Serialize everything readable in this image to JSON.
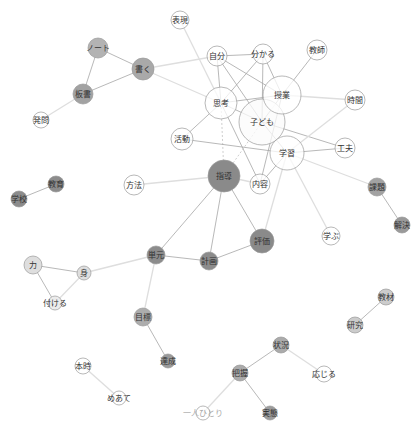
{
  "diagram": {
    "type": "co-occurrence-network",
    "width": 419,
    "height": 429,
    "colors": {
      "background": "#ffffff",
      "edge_solid": "#a6a6a6",
      "edge_light": "#dedede",
      "edge_dashed": "#c2c2c2",
      "node_stroke": "#9a9a9a",
      "label": "#333333",
      "label_faint": "#a8a8a8"
    },
    "nodes": [
      {
        "label": "表現",
        "x": 180,
        "y": 20,
        "r": 9,
        "fill": "#ffffff"
      },
      {
        "label": "ノート",
        "x": 98,
        "y": 48,
        "r": 10,
        "fill": "#b3b3b3"
      },
      {
        "label": "書く",
        "x": 143,
        "y": 69,
        "r": 11,
        "fill": "#a9a9a9"
      },
      {
        "label": "板書",
        "x": 83,
        "y": 94,
        "r": 10,
        "fill": "#a2a2a2"
      },
      {
        "label": "発問",
        "x": 41,
        "y": 120,
        "r": 8,
        "fill": "#ffffff"
      },
      {
        "label": "自分",
        "x": 217,
        "y": 56,
        "r": 10,
        "fill": "#ffffff"
      },
      {
        "label": "分かる",
        "x": 263,
        "y": 54,
        "r": 10,
        "fill": "#ffffff"
      },
      {
        "label": "教師",
        "x": 317,
        "y": 50,
        "r": 10,
        "fill": "#ffffff"
      },
      {
        "label": "思考",
        "x": 221,
        "y": 103,
        "r": 16,
        "fill": "#ffffff"
      },
      {
        "label": "授業",
        "x": 282,
        "y": 95,
        "r": 19,
        "fill": "#ffffff"
      },
      {
        "label": "子ども",
        "x": 262,
        "y": 122,
        "r": 23,
        "fill": "#fbfbfb"
      },
      {
        "label": "時間",
        "x": 355,
        "y": 100,
        "r": 10,
        "fill": "#ffffff"
      },
      {
        "label": "活動",
        "x": 182,
        "y": 139,
        "r": 11,
        "fill": "#ffffff"
      },
      {
        "label": "工夫",
        "x": 345,
        "y": 148,
        "r": 10,
        "fill": "#ffffff"
      },
      {
        "label": "学習",
        "x": 287,
        "y": 153,
        "r": 17,
        "fill": "#ffffff"
      },
      {
        "label": "指導",
        "x": 224,
        "y": 176,
        "r": 16,
        "fill": "#8a8a8a"
      },
      {
        "label": "内容",
        "x": 260,
        "y": 184,
        "r": 10,
        "fill": "#ffffff"
      },
      {
        "label": "方法",
        "x": 134,
        "y": 185,
        "r": 10,
        "fill": "#ffffff"
      },
      {
        "label": "教育",
        "x": 56,
        "y": 184,
        "r": 8,
        "fill": "#8c8c8c"
      },
      {
        "label": "学校",
        "x": 19,
        "y": 199,
        "r": 8,
        "fill": "#8c8c8c"
      },
      {
        "label": "課題",
        "x": 377,
        "y": 187,
        "r": 9,
        "fill": "#a2a2a2"
      },
      {
        "label": "解決",
        "x": 402,
        "y": 225,
        "r": 8,
        "fill": "#9a9a9a"
      },
      {
        "label": "学ぶ",
        "x": 331,
        "y": 236,
        "r": 9,
        "fill": "#ffffff"
      },
      {
        "label": "評価",
        "x": 262,
        "y": 241,
        "r": 12,
        "fill": "#8a8a8a"
      },
      {
        "label": "計画",
        "x": 209,
        "y": 261,
        "r": 9,
        "fill": "#8c8c8c"
      },
      {
        "label": "単元",
        "x": 156,
        "y": 255,
        "r": 9,
        "fill": "#8c8c8c"
      },
      {
        "label": "力",
        "x": 33,
        "y": 265,
        "r": 9,
        "fill": "#dedede"
      },
      {
        "label": "身",
        "x": 84,
        "y": 273,
        "r": 7,
        "fill": "#dedede"
      },
      {
        "label": "付ける",
        "x": 55,
        "y": 303,
        "r": 7,
        "fill": "#ececec"
      },
      {
        "label": "目標",
        "x": 143,
        "y": 317,
        "r": 9,
        "fill": "#adadad"
      },
      {
        "label": "達成",
        "x": 168,
        "y": 361,
        "r": 7,
        "fill": "#9a9a9a"
      },
      {
        "label": "教材",
        "x": 386,
        "y": 297,
        "r": 8,
        "fill": "#cccccc"
      },
      {
        "label": "研究",
        "x": 355,
        "y": 325,
        "r": 8,
        "fill": "#cccccc"
      },
      {
        "label": "状況",
        "x": 281,
        "y": 345,
        "r": 8,
        "fill": "#ababab"
      },
      {
        "label": "把握",
        "x": 240,
        "y": 373,
        "r": 8,
        "fill": "#ababab"
      },
      {
        "label": "応じる",
        "x": 324,
        "y": 374,
        "r": 8,
        "fill": "#ffffff"
      },
      {
        "label": "実態",
        "x": 270,
        "y": 413,
        "r": 7,
        "fill": "#9c9c9c"
      },
      {
        "label": "本時",
        "x": 83,
        "y": 366,
        "r": 8,
        "fill": "#ffffff"
      },
      {
        "label": "めあて",
        "x": 119,
        "y": 398,
        "r": 7,
        "fill": "#ffffff"
      },
      {
        "label": "一人ひとり",
        "x": 203,
        "y": 413,
        "r": 7,
        "fill": "#ffffff",
        "faint": true
      }
    ],
    "edges": [
      {
        "from": "ノート",
        "to": "書く",
        "style": "solid"
      },
      {
        "from": "ノート",
        "to": "板書",
        "style": "solid"
      },
      {
        "from": "書く",
        "to": "板書",
        "style": "solid"
      },
      {
        "from": "板書",
        "to": "発問",
        "style": "light"
      },
      {
        "from": "書く",
        "to": "自分",
        "style": "light"
      },
      {
        "from": "書く",
        "to": "思考",
        "style": "light"
      },
      {
        "from": "表現",
        "to": "思考",
        "style": "light"
      },
      {
        "from": "自分",
        "to": "分かる",
        "style": "solid"
      },
      {
        "from": "自分",
        "to": "思考",
        "style": "solid"
      },
      {
        "from": "自分",
        "to": "授業",
        "style": "solid"
      },
      {
        "from": "自分",
        "to": "子ども",
        "style": "solid"
      },
      {
        "from": "分かる",
        "to": "思考",
        "style": "solid"
      },
      {
        "from": "分かる",
        "to": "授業",
        "style": "solid"
      },
      {
        "from": "分かる",
        "to": "子ども",
        "style": "solid"
      },
      {
        "from": "教師",
        "to": "授業",
        "style": "solid"
      },
      {
        "from": "思考",
        "to": "授業",
        "style": "solid"
      },
      {
        "from": "思考",
        "to": "子ども",
        "style": "solid"
      },
      {
        "from": "思考",
        "to": "活動",
        "style": "solid"
      },
      {
        "from": "思考",
        "to": "内容",
        "style": "solid"
      },
      {
        "from": "思考",
        "to": "指導",
        "style": "dashed"
      },
      {
        "from": "授業",
        "to": "子ども",
        "style": "solid"
      },
      {
        "from": "授業",
        "to": "時間",
        "style": "light"
      },
      {
        "from": "授業",
        "to": "内容",
        "style": "solid"
      },
      {
        "from": "子ども",
        "to": "工夫",
        "style": "solid"
      },
      {
        "from": "子ども",
        "to": "学習",
        "style": "solid"
      },
      {
        "from": "子ども",
        "to": "指導",
        "style": "dashed"
      },
      {
        "from": "活動",
        "to": "学習",
        "style": "solid"
      },
      {
        "from": "学習",
        "to": "工夫",
        "style": "solid"
      },
      {
        "from": "学習",
        "to": "内容",
        "style": "solid"
      },
      {
        "from": "学習",
        "to": "時間",
        "style": "light"
      },
      {
        "from": "学習",
        "to": "課題",
        "style": "light"
      },
      {
        "from": "学習",
        "to": "学ぶ",
        "style": "light"
      },
      {
        "from": "学習",
        "to": "評価",
        "style": "light"
      },
      {
        "from": "課題",
        "to": "解決",
        "style": "solid"
      },
      {
        "from": "指導",
        "to": "方法",
        "style": "light"
      },
      {
        "from": "指導",
        "to": "内容",
        "style": "light"
      },
      {
        "from": "指導",
        "to": "単元",
        "style": "solid"
      },
      {
        "from": "指導",
        "to": "計画",
        "style": "solid"
      },
      {
        "from": "指導",
        "to": "評価",
        "style": "solid"
      },
      {
        "from": "単元",
        "to": "計画",
        "style": "solid"
      },
      {
        "from": "計画",
        "to": "評価",
        "style": "solid"
      },
      {
        "from": "単元",
        "to": "身",
        "style": "light"
      },
      {
        "from": "単元",
        "to": "目標",
        "style": "light"
      },
      {
        "from": "目標",
        "to": "達成",
        "style": "solid"
      },
      {
        "from": "力",
        "to": "身",
        "style": "solid"
      },
      {
        "from": "力",
        "to": "付ける",
        "style": "solid"
      },
      {
        "from": "身",
        "to": "付ける",
        "style": "light"
      },
      {
        "from": "教育",
        "to": "学校",
        "style": "solid"
      },
      {
        "from": "教材",
        "to": "研究",
        "style": "solid"
      },
      {
        "from": "状況",
        "to": "把握",
        "style": "solid"
      },
      {
        "from": "状況",
        "to": "応じる",
        "style": "light"
      },
      {
        "from": "把握",
        "to": "実態",
        "style": "solid"
      },
      {
        "from": "把握",
        "to": "一人ひとり",
        "style": "light"
      },
      {
        "from": "本時",
        "to": "めあて",
        "style": "light"
      }
    ]
  }
}
